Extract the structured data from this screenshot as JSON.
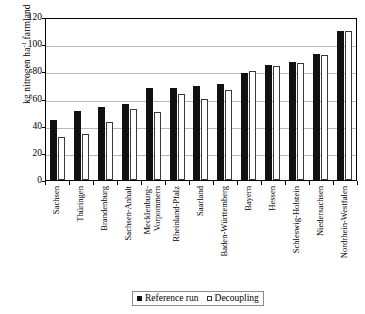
{
  "chart_data": {
    "type": "bar",
    "title": "",
    "xlabel": "",
    "ylabel": "kg nitrogen ha-1 farmland",
    "ylabel_parts": {
      "pre": "kg nitrogen ha",
      "sup": "-1",
      "post": " farmland"
    },
    "ylim": [
      0,
      120
    ],
    "yticks": [
      0,
      20,
      40,
      60,
      80,
      100,
      120
    ],
    "grid": true,
    "legend_position": "bottom-center",
    "categories": [
      "Sachsen",
      "Thüringen",
      "Brandenburg",
      "Sachsen-Anhalt",
      "Mecklenburg-\nVorpommern",
      "Rheinland-Pfalz",
      "Saarland",
      "Baden-Württemberg",
      "Bayern",
      "Hessen",
      "Schleswig-Holstein",
      "Niedersachsen",
      "Nordrhein-Westfalen"
    ],
    "series": [
      {
        "name": "Reference run",
        "color": "#111111",
        "values": [
          44,
          51,
          54,
          56,
          68,
          68,
          69,
          71,
          79,
          85,
          87,
          93,
          110
        ]
      },
      {
        "name": "Decoupling",
        "color": "#ffffff",
        "values": [
          32,
          34,
          43,
          52,
          50,
          63,
          60,
          66,
          80,
          84,
          86,
          92,
          110
        ]
      }
    ]
  },
  "legend": {
    "items": [
      {
        "label": "Reference run",
        "marker": "filled-square"
      },
      {
        "label": "Decoupling",
        "marker": "open-square"
      }
    ]
  }
}
